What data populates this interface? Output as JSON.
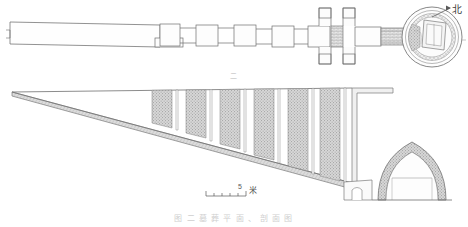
{
  "figure": {
    "title_caption": "图 二  墓 葬 平 面 、 剖 面 图",
    "figure_mark": "二",
    "north_label": "北",
    "north_icon": "north-arrow-icon",
    "scale": {
      "value": "5",
      "unit": "米",
      "divisions": 5
    },
    "background_color": "#ffffff",
    "line_color": "#6e6e6e",
    "hatch_color": "#a8a8a8",
    "fill_color": "#c9c9c9"
  },
  "plan": {
    "name": "tomb-plan-view",
    "ramp": {
      "label": "斜坡墓道",
      "length_px": 300
    },
    "gate_chambers": [
      {
        "label": "过洞一"
      },
      {
        "label": "过洞二"
      },
      {
        "label": "过洞三"
      },
      {
        "label": "过洞四"
      },
      {
        "label": "过洞五"
      }
    ],
    "cross_shafts": [
      {
        "label": "天井一"
      },
      {
        "label": "天井二"
      }
    ],
    "entry_corridor": {
      "label": "甬道"
    },
    "burial_chamber": {
      "label": "圆形墓室",
      "shape": "circular",
      "interior_features": [
        {
          "label": "棺床"
        },
        {
          "label": "砖砌台"
        }
      ]
    }
  },
  "section": {
    "name": "tomb-section-view",
    "slope_label": "斜坡墓道剖面",
    "shafts": [
      {
        "label": "竖井一",
        "fill": "stipple"
      },
      {
        "label": "竖井二",
        "fill": "stipple"
      },
      {
        "label": "竖井三",
        "fill": "stipple"
      },
      {
        "label": "竖井四",
        "fill": "stipple"
      },
      {
        "label": "竖井五",
        "fill": "stipple"
      },
      {
        "label": "竖井六",
        "fill": "stipple"
      },
      {
        "label": "竖井七",
        "fill": "stipple"
      },
      {
        "label": "竖井八",
        "fill": "stipple"
      }
    ],
    "vaulted_chamber": {
      "label": "穹窿顶墓室",
      "shape": "pointed-arch"
    },
    "doorway": {
      "label": "墓门"
    }
  }
}
